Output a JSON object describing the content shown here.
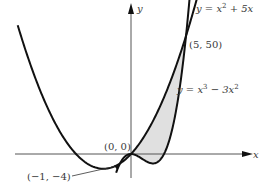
{
  "figure": {
    "type": "region-between-curves",
    "axes": {
      "x_label": "x",
      "y_label": "y"
    },
    "curves": [
      {
        "name": "parabola",
        "equation_prefix": "y = x",
        "equation_exp": "2",
        "equation_suffix": " + 5x"
      },
      {
        "name": "cubic",
        "equation_prefix": "y = x",
        "equation_exp1": "3",
        "equation_mid": " − 3x",
        "equation_exp2": "2"
      }
    ],
    "points": [
      {
        "label": "(5, 50)",
        "x": 5,
        "y": 50
      },
      {
        "label": "(0, 0)",
        "x": 0,
        "y": 0
      },
      {
        "label": "(−1, −4)",
        "x": -1,
        "y": -4
      }
    ],
    "shaded_region": "between curves from x = 0 to x = 5",
    "colors": {
      "curve": "#111111",
      "axis": "#555555",
      "shade": "#e0e0e0"
    }
  }
}
